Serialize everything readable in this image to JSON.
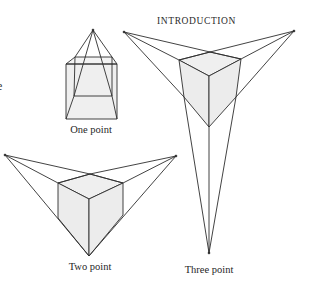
{
  "header": {
    "title": "INTRODUCTION"
  },
  "margin_text": {
    "cut_off_glyph": "e"
  },
  "figures": [
    {
      "id": "one-point",
      "caption": "One point",
      "vanishing_points": [
        [
          93,
          30
        ]
      ]
    },
    {
      "id": "two-point",
      "caption": "Two point",
      "vanishing_points": [
        [
          5,
          155
        ],
        [
          176,
          156
        ]
      ]
    },
    {
      "id": "three-point",
      "caption": "Three point",
      "vanishing_points": [
        [
          124,
          32
        ],
        [
          294,
          31
        ],
        [
          209,
          253
        ]
      ]
    }
  ],
  "colors": {
    "line": "#2e2e2e",
    "face_fill": "#ededed",
    "background": "#ffffff"
  }
}
